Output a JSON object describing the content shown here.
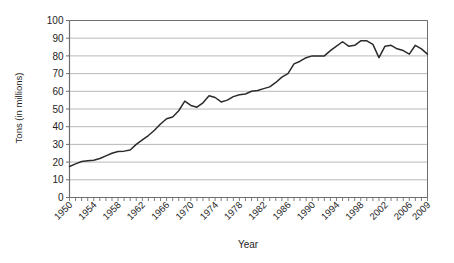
{
  "chart_data": {
    "type": "line",
    "title": "",
    "xlabel": "Year",
    "ylabel": "Tons (in millions)",
    "xlim": [
      1950,
      2009
    ],
    "ylim": [
      0,
      100
    ],
    "grid": true,
    "legend": "none",
    "y_ticks": [
      0,
      10,
      20,
      30,
      40,
      50,
      60,
      70,
      80,
      90,
      100
    ],
    "y_tick_labels": [
      "0",
      "10",
      "20",
      "30",
      "40",
      "50",
      "60",
      "70",
      "80",
      "90",
      "100"
    ],
    "x_tick_labels": [
      "1950",
      "1954",
      "1958",
      "1962",
      "1966",
      "1970",
      "1974",
      "1978",
      "1982",
      "1986",
      "1990",
      "1994",
      "1998",
      "2002",
      "2006",
      "2009"
    ],
    "x_tick_label_years": [
      1950,
      1954,
      1958,
      1962,
      1966,
      1970,
      1974,
      1978,
      1982,
      1986,
      1990,
      1994,
      1998,
      2002,
      2006,
      2009
    ],
    "x_minor_tick_step": 1,
    "line_color": "#2b2b2b",
    "gridline_color": "#b0b0b0",
    "axis_color": "#6e6e6e",
    "x": [
      1950,
      1951,
      1952,
      1953,
      1954,
      1955,
      1956,
      1957,
      1958,
      1959,
      1960,
      1961,
      1962,
      1963,
      1964,
      1965,
      1966,
      1967,
      1968,
      1969,
      1970,
      1971,
      1972,
      1973,
      1974,
      1975,
      1976,
      1977,
      1978,
      1979,
      1980,
      1981,
      1982,
      1983,
      1984,
      1985,
      1986,
      1987,
      1988,
      1989,
      1990,
      1991,
      1992,
      1993,
      1994,
      1995,
      1996,
      1997,
      1998,
      1999,
      2000,
      2001,
      2002,
      2003,
      2004,
      2005,
      2006,
      2007,
      2008,
      2009
    ],
    "values": [
      17.5,
      19.0,
      20.3,
      20.8,
      21.0,
      22.0,
      23.5,
      25.0,
      26.0,
      26.2,
      26.8,
      30.0,
      32.5,
      35.0,
      38.0,
      41.5,
      44.5,
      45.5,
      49.0,
      54.5,
      52.0,
      51.0,
      53.5,
      57.5,
      56.5,
      54.0,
      55.0,
      57.0,
      58.0,
      58.5,
      60.0,
      60.5,
      61.5,
      62.5,
      65.0,
      68.0,
      70.0,
      75.5,
      77.0,
      79.0,
      80.0,
      80.0,
      80.0,
      83.0,
      85.5,
      88.0,
      85.5,
      86.0,
      88.5,
      88.5,
      86.5,
      79.0,
      85.5,
      86.0,
      84.0,
      83.0,
      81.0,
      86.0,
      84.0,
      81.0
    ],
    "series_name": "Tons"
  }
}
